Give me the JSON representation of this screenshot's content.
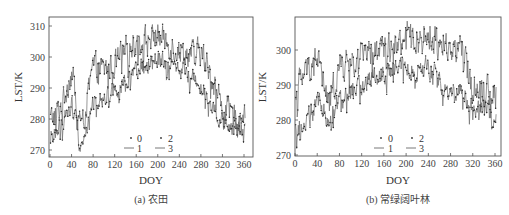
{
  "chart_data": [
    {
      "type": "line",
      "panel": "a",
      "caption": "(a) 农田",
      "xlabel": "DOY",
      "ylabel": "LST/K",
      "xlim": [
        0,
        365
      ],
      "ylim": [
        269,
        311
      ],
      "xticks": [
        0,
        40,
        80,
        120,
        160,
        200,
        240,
        280,
        320,
        360
      ],
      "yticks": [
        270,
        280,
        290,
        300,
        310
      ],
      "grid": false,
      "legend": {
        "position": "lower center",
        "entries": [
          {
            "label": "0",
            "marker": "dot"
          },
          {
            "label": "1",
            "marker": "line"
          },
          {
            "label": "2",
            "marker": "dot"
          },
          {
            "label": "3",
            "marker": "line"
          }
        ]
      },
      "x": [
        0,
        20,
        40,
        60,
        80,
        100,
        120,
        140,
        160,
        180,
        200,
        220,
        240,
        260,
        280,
        300,
        320,
        340,
        360
      ],
      "series": [
        {
          "name": "0",
          "style": "dot",
          "values": [
            279,
            284,
            296,
            276,
            298,
            297,
            299,
            303,
            306,
            307,
            308,
            305,
            303,
            302,
            303,
            295,
            285,
            282,
            284
          ]
        },
        {
          "name": "1",
          "style": "line",
          "values": [
            280,
            284,
            295,
            277,
            297,
            296,
            298,
            302,
            305,
            306,
            307,
            304,
            302,
            301,
            302,
            294,
            284,
            281,
            283
          ]
        },
        {
          "name": "2",
          "style": "dot",
          "values": [
            273,
            277,
            284,
            271,
            286,
            288,
            289,
            290,
            296,
            298,
            300,
            298,
            298,
            293,
            290,
            287,
            277,
            278,
            275
          ]
        },
        {
          "name": "3",
          "style": "line",
          "values": [
            274,
            278,
            285,
            272,
            285,
            287,
            290,
            291,
            295,
            297,
            299,
            297,
            297,
            294,
            291,
            286,
            278,
            277,
            276
          ]
        }
      ]
    },
    {
      "type": "line",
      "panel": "b",
      "caption": "(b) 常绿阔叶林",
      "xlabel": "DOY",
      "ylabel": "LST/K",
      "xlim": [
        0,
        365
      ],
      "ylim": [
        270,
        309
      ],
      "xticks": [
        0,
        40,
        80,
        120,
        160,
        200,
        240,
        280,
        320,
        360
      ],
      "yticks": [
        270,
        280,
        290,
        300
      ],
      "grid": false,
      "legend": {
        "position": "lower center",
        "entries": [
          {
            "label": "0",
            "marker": "dot"
          },
          {
            "label": "1",
            "marker": "line"
          },
          {
            "label": "2",
            "marker": "dot"
          },
          {
            "label": "3",
            "marker": "line"
          }
        ]
      },
      "x": [
        0,
        20,
        40,
        60,
        80,
        100,
        120,
        140,
        160,
        180,
        200,
        220,
        240,
        260,
        280,
        300,
        320,
        340,
        360
      ],
      "series": [
        {
          "name": "0",
          "style": "dot",
          "values": [
            290,
            295,
            300,
            283,
            296,
            298,
            300,
            300,
            302,
            302,
            305,
            304,
            305,
            304,
            302,
            301,
            290,
            291,
            288
          ]
        },
        {
          "name": "1",
          "style": "line",
          "values": [
            289,
            294,
            299,
            284,
            295,
            297,
            299,
            299,
            301,
            301,
            304,
            303,
            304,
            303,
            301,
            300,
            289,
            290,
            287
          ]
        },
        {
          "name": "2",
          "style": "dot",
          "values": [
            276,
            278,
            287,
            279,
            287,
            289,
            289,
            291,
            292,
            294,
            296,
            295,
            296,
            292,
            289,
            290,
            281,
            285,
            282
          ]
        },
        {
          "name": "3",
          "style": "line",
          "values": [
            277,
            279,
            286,
            280,
            286,
            288,
            290,
            292,
            293,
            295,
            295,
            294,
            295,
            291,
            288,
            289,
            282,
            284,
            281
          ]
        }
      ]
    }
  ],
  "panels": [
    {
      "caption": "(a) 农田",
      "xlabel": "DOY",
      "ylabel": "LST/K",
      "xtick_labels": [
        "0",
        "40",
        "80",
        "120",
        "160",
        "200",
        "240",
        "280",
        "320",
        "360"
      ],
      "ytick_labels": [
        "270",
        "280",
        "290",
        "300",
        "310"
      ],
      "legend": [
        "0",
        "1",
        "2",
        "3"
      ]
    },
    {
      "caption": "(b) 常绿阔叶林",
      "xlabel": "DOY",
      "ylabel": "LST/K",
      "xtick_labels": [
        "0",
        "40",
        "80",
        "120",
        "160",
        "200",
        "240",
        "280",
        "320",
        "360"
      ],
      "ytick_labels": [
        "270",
        "280",
        "290",
        "300"
      ],
      "legend": [
        "0",
        "1",
        "2",
        "3"
      ]
    }
  ],
  "colors": {
    "line": "#6a6a6a",
    "dot": "#2a2a2a",
    "axis": "#555555",
    "text": "#333333"
  }
}
